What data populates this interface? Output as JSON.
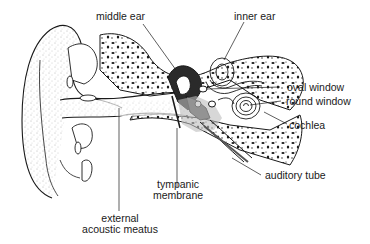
{
  "diagram": {
    "type": "anatomical cross-section",
    "labels": {
      "middle_ear": "middle ear",
      "inner_ear": "inner ear",
      "oval_window": "oval window",
      "round_window": "round window",
      "cochlea": "cochlea",
      "auditory_tube": "auditory tube",
      "tympanic_membrane_1": "tympanic",
      "tympanic_membrane_2": "membrane",
      "external_acoustic_meatus_1": "external",
      "external_acoustic_meatus_2": "acoustic meatus"
    },
    "colors": {
      "ink": "#1a1a1a",
      "background": "#ffffff",
      "shade": "#bdbdbd"
    }
  }
}
